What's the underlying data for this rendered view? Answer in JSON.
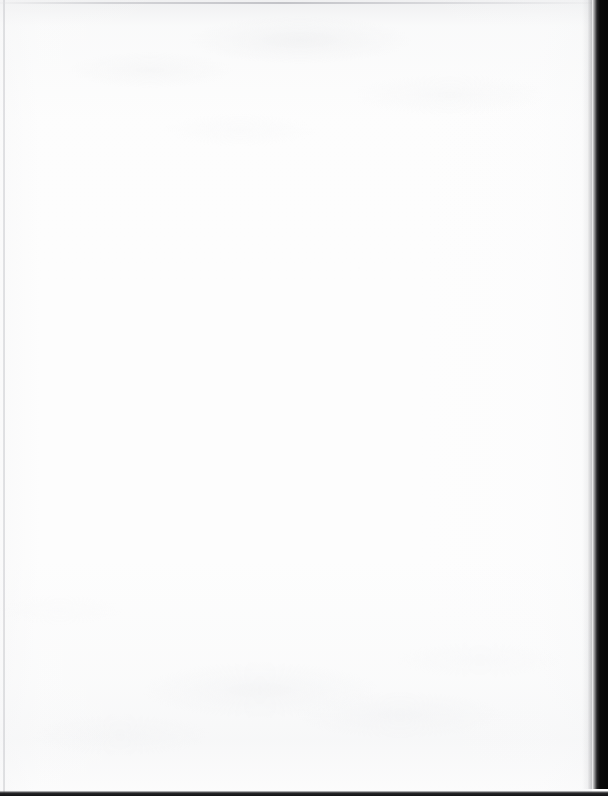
{
  "document": {
    "kind": "scanned-page",
    "page_state": "blank",
    "visible_text": "",
    "content_blocks": []
  },
  "canvas": {
    "width": 608,
    "height": 796,
    "background_color": "#ffffff"
  },
  "paper": {
    "name": "paper-sheet",
    "width": 592,
    "height": 796,
    "base_color": "#fdfdfd",
    "tint_color": "#f6f7f8",
    "grain_color": "#e6e7ea",
    "description": "Blank off-white scanned sheet with faint mottled paper grain and show-through shading near the top edge and lower-middle."
  },
  "artifacts": {
    "left_edge_line": {
      "name": "left-edge-line",
      "x": 3,
      "width": 2,
      "color": "#c4c5c9",
      "orientation": "vertical"
    },
    "top_edge_line": {
      "name": "top-edge-line",
      "y": 2,
      "height": 2,
      "color": "#babbc0",
      "orientation": "horizontal"
    },
    "right_gutter_band": {
      "name": "right-gutter-band",
      "x_start": 592,
      "x_end": 608,
      "y_start": 0,
      "y_end": 789,
      "color": "#060606",
      "orientation": "vertical",
      "description": "Near-black scanner gutter shadow beyond the right page edge."
    },
    "bottom_edge_line": {
      "name": "bottom-edge-line",
      "y_start": 791,
      "height": 5,
      "color": "#121214",
      "orientation": "horizontal"
    }
  },
  "colors": {
    "paper": "#fdfdfd",
    "paper_shadow": "#eeeff1",
    "edge_light": "#c4c5c9",
    "gutter_dark": "#060606",
    "canvas": "#ffffff"
  }
}
